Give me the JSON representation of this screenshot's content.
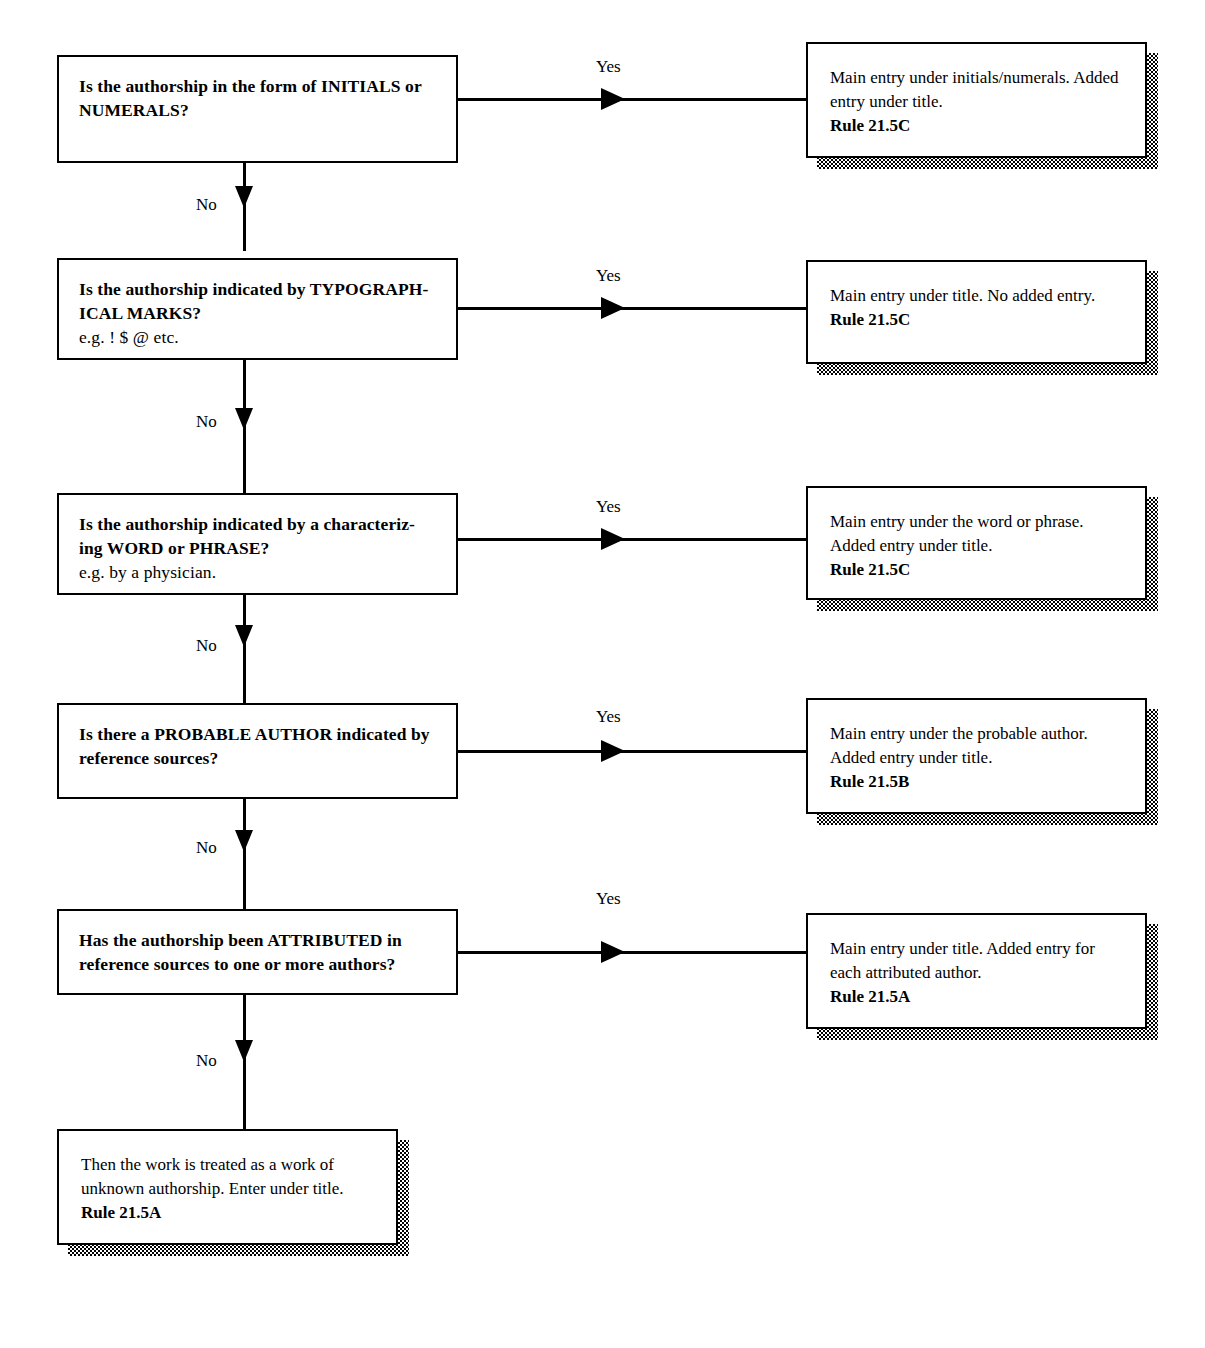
{
  "diagram": {
    "edge_labels": {
      "yes": "Yes",
      "no": "No"
    }
  },
  "questions": [
    {
      "id": "q1",
      "main": "Is the authorship in the form of INITIALS or NUMERALS?",
      "example": ""
    },
    {
      "id": "q2",
      "main": "Is the authorship indicated by TYPOGRAPH-ICAL MARKS?",
      "example": "e.g. ! $ @ etc."
    },
    {
      "id": "q3",
      "main": "Is the authorship indicated by a characteriz-ing WORD or PHRASE?",
      "example": "e.g. by a physician."
    },
    {
      "id": "q4",
      "main": "Is there a PROBABLE AUTHOR indicated by reference sources?",
      "example": ""
    },
    {
      "id": "q5",
      "main": "Has the authorship been ATTRIBUTED in reference sources to one or more authors?",
      "example": ""
    }
  ],
  "results": [
    {
      "id": "r1",
      "text": "Main entry under initials/numerals. Added entry under title.",
      "rule": "Rule 21.5C"
    },
    {
      "id": "r2",
      "text": "Main entry under title. No added entry.",
      "rule": "Rule 21.5C"
    },
    {
      "id": "r3",
      "text": "Main entry under the word or phrase. Added entry under title.",
      "rule": "Rule 21.5C"
    },
    {
      "id": "r4",
      "text": "Main entry under the probable author. Added entry under title.",
      "rule": "Rule 21.5B"
    },
    {
      "id": "r5",
      "text": "Main entry under title. Added entry for each attributed author.",
      "rule": "Rule 21.5A"
    }
  ],
  "terminal": {
    "id": "t1",
    "text": "Then the work is treated as a work of unknown authorship. Enter under title.",
    "rule": "Rule 21.5A"
  },
  "edges": {
    "yes": [
      "Yes",
      "Yes",
      "Yes",
      "Yes",
      "Yes"
    ],
    "no": [
      "No",
      "No",
      "No",
      "No",
      "No"
    ]
  }
}
